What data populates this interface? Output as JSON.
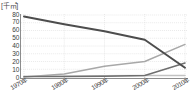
{
  "chart_data": {
    "type": "line",
    "title": "",
    "subtitle": "",
    "unit_label": "[千㎡]",
    "xlabel": "",
    "ylabel": "",
    "ylim": [
      0,
      80
    ],
    "yticks": [
      80,
      70,
      60,
      50,
      40,
      30,
      20,
      10,
      0
    ],
    "ytick_labels": [
      "80",
      "70",
      "60",
      "50",
      "40",
      "30",
      "20",
      "10",
      "0"
    ],
    "x": [
      1970,
      1980,
      1990,
      2000,
      2010
    ],
    "xtick_labels": [
      "1970年",
      "1980年",
      "1990年",
      "2000年",
      "2010年"
    ],
    "grid": true,
    "grid_style": "dotted",
    "legend": "none",
    "series": [
      {
        "name": "series-1-declining",
        "color": "#4d4d4d",
        "values": [
          78,
          68,
          59,
          48,
          12
        ]
      },
      {
        "name": "series-2-rising",
        "color": "#a8a8a8",
        "values": [
          0,
          4,
          14,
          20,
          42
        ]
      },
      {
        "name": "series-3-rising-late",
        "color": "#6f6f6f",
        "values": [
          0.5,
          0.8,
          1,
          2,
          18
        ]
      },
      {
        "name": "series-4-flat",
        "color": "#c2c2c2",
        "values": [
          1,
          1,
          1.5,
          2,
          2
        ]
      }
    ]
  },
  "axis": {
    "unit": "[千㎡]",
    "y_ticks": [
      "80",
      "70",
      "60",
      "50",
      "40",
      "30",
      "20",
      "10",
      "0"
    ],
    "x_ticks": [
      {
        "year": "1970",
        "suffix": "年"
      },
      {
        "year": "1980",
        "suffix": "年"
      },
      {
        "year": "1990",
        "suffix": "年"
      },
      {
        "year": "2000",
        "suffix": "年"
      },
      {
        "year": "2010",
        "suffix": "年"
      }
    ]
  },
  "colors": {
    "axis": "#8c8c8c",
    "grid": "#d9d9d9",
    "text": "#3c3c3c",
    "series_dark": "#4d4d4d",
    "series_mid": "#6f6f6f",
    "series_light": "#a8a8a8",
    "series_pale": "#c2c2c2",
    "background": "#ffffff"
  }
}
